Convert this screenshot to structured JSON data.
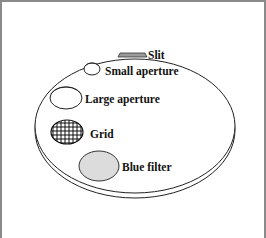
{
  "diagram": {
    "title": "",
    "object": "filter wheel disk",
    "labels": {
      "slit": "Slit",
      "small_aperture": "Small aperture",
      "large_aperture": "Large aperture",
      "grid": "Grid",
      "blue_filter": "Blue filter"
    },
    "colors": {
      "border": "#8a8a8a",
      "outline": "#222222",
      "slit_fill": "#999999",
      "blue_filter_fill": "#dcdcdc",
      "background": "#ffffff"
    }
  }
}
